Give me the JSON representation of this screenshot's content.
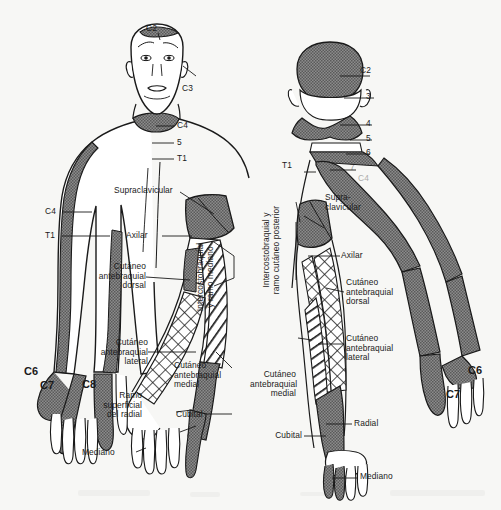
{
  "figure": {
    "background_color": "#f7f7f5",
    "ink_color": "#1a1a1a",
    "shade_color": "#6e6e6e"
  },
  "anterior": {
    "view_name": "Vista anterior",
    "dermatomes": [
      {
        "id": "c2-head",
        "label": "C2"
      },
      {
        "id": "c3-neck",
        "label": "C3"
      },
      {
        "id": "c4-neck",
        "label": "C4"
      },
      {
        "id": "c5-chest",
        "label": "5"
      },
      {
        "id": "t1-chest",
        "label": "T1"
      },
      {
        "id": "c4-arm",
        "label": "C4"
      },
      {
        "id": "t1-arm",
        "label": "T1"
      },
      {
        "id": "c6-hand",
        "label": "C6"
      },
      {
        "id": "c7-hand",
        "label": "C7"
      },
      {
        "id": "c8-hand",
        "label": "C8"
      }
    ],
    "nerves": [
      {
        "id": "supraclavicular",
        "label": "Supraclavicular"
      },
      {
        "id": "axilar",
        "label": "Axilar"
      },
      {
        "id": "cutaneo-antebraquial-dorsal",
        "label": "Cutáneo\nantebraquial\ndorsal"
      },
      {
        "id": "cutaneo-antebraquial-lateral",
        "label": "Cutáneo\nantebraquial\nlateral"
      },
      {
        "id": "cutaneo-antebraquial-medial",
        "label": "Cutáneo\nantebraquial\nmedial"
      },
      {
        "id": "intercostobraquial-ramo-mediano",
        "label": "Intercostobraquial\ny ramo mediano"
      },
      {
        "id": "ramo-superficial-del-radial",
        "label": "Ramo\nsuperficial\ndel radial"
      },
      {
        "id": "cubital",
        "label": "Cubital"
      },
      {
        "id": "mediano",
        "label": "Mediano"
      }
    ]
  },
  "posterior": {
    "view_name": "Vista posterior",
    "dermatomes": [
      {
        "id": "c2-head",
        "label": "C2"
      },
      {
        "id": "c3-neck",
        "label": "3"
      },
      {
        "id": "c4-neck",
        "label": "4"
      },
      {
        "id": "c5-neck",
        "label": "5"
      },
      {
        "id": "c6-neck",
        "label": "6"
      },
      {
        "id": "c7-neck",
        "label": "7"
      },
      {
        "id": "t1-shoulder",
        "label": "T1"
      },
      {
        "id": "c4-shoulder",
        "label": "C4"
      },
      {
        "id": "c6-hand",
        "label": "C6"
      },
      {
        "id": "c7-hand",
        "label": "C7"
      }
    ],
    "nerves": [
      {
        "id": "supraclavicular",
        "label": "Supra-\nclavicular"
      },
      {
        "id": "axilar",
        "label": "Axilar"
      },
      {
        "id": "intercostobraquial-ramo-cutaneo-posterior",
        "label": "Intercostobraquial y\nramo cutáneo posterior"
      },
      {
        "id": "cutaneo-antebraquial-dorsal",
        "label": "Cutáneo\nantebraquial\ndorsal"
      },
      {
        "id": "cutaneo-antebraquial-lateral",
        "label": "Cutáneo\nantebraquial\nlateral"
      },
      {
        "id": "cutaneo-antebraquial-medial",
        "label": "Cutáneo\nantebraquial\nmedial"
      },
      {
        "id": "radial",
        "label": "Radial"
      },
      {
        "id": "cubital",
        "label": "Cubital"
      },
      {
        "id": "mediano",
        "label": "Mediano"
      }
    ]
  }
}
